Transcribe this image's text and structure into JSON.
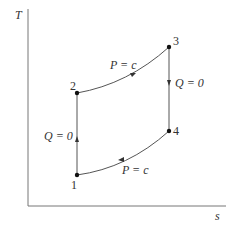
{
  "diagram": {
    "type": "T-s diagram (Brayton cycle)",
    "axes": {
      "y_label": "T",
      "x_label": "s"
    },
    "points": [
      {
        "id": "1",
        "label": "1"
      },
      {
        "id": "2",
        "label": "2"
      },
      {
        "id": "3",
        "label": "3"
      },
      {
        "id": "4",
        "label": "4"
      }
    ],
    "processes": [
      {
        "from": "1",
        "to": "2",
        "label": "Q = 0"
      },
      {
        "from": "2",
        "to": "3",
        "label": "P = c"
      },
      {
        "from": "3",
        "to": "4",
        "label": "Q = 0"
      },
      {
        "from": "4",
        "to": "1",
        "label": "P = c"
      }
    ],
    "colors": {
      "line": "#555555",
      "text": "#333333",
      "background": "#ffffff"
    }
  }
}
